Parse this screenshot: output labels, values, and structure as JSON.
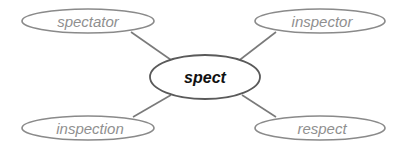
{
  "diagram": {
    "type": "word-web",
    "center": {
      "label": "spect"
    },
    "nodes": [
      {
        "label": "spectator",
        "position": "top-left"
      },
      {
        "label": "inspector",
        "position": "top-right"
      },
      {
        "label": "inspection",
        "position": "bottom-left"
      },
      {
        "label": "respect",
        "position": "bottom-right"
      }
    ],
    "colors": {
      "outer_stroke": "#8a8a8a",
      "outer_text": "#8f8f8f",
      "center_stroke": "#5a5a5a",
      "center_text": "#111111",
      "connector": "#7a7a7a",
      "background": "#ffffff"
    }
  }
}
